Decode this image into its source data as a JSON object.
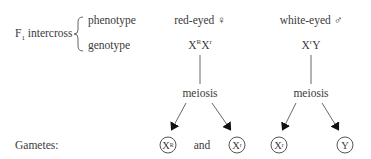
{
  "cross": {
    "label_main": "F",
    "label_sub": "1",
    "label_rest": " intercross",
    "rows": [
      "phenotype",
      "genotype"
    ]
  },
  "female": {
    "phenotype": "red-eyed ♀",
    "genotype_parts": [
      {
        "base": "X",
        "sup": "R"
      },
      {
        "base": "X",
        "sup": "r"
      }
    ],
    "process": "meiosis",
    "gametes": [
      {
        "base": "X",
        "sup": "R"
      },
      {
        "base": "X",
        "sup": "r"
      }
    ]
  },
  "male": {
    "phenotype": "white-eyed ♂",
    "genotype_parts": [
      {
        "base": "X",
        "sup": "r"
      },
      {
        "base": "Y",
        "sup": ""
      }
    ],
    "process": "meiosis",
    "gametes": [
      {
        "base": "X",
        "sup": "r"
      },
      {
        "base": "Y",
        "sup": ""
      }
    ]
  },
  "gametes_label": "Gametes:",
  "connector": "and",
  "colors": {
    "text": "#3a3a3a",
    "line": "#555555"
  }
}
